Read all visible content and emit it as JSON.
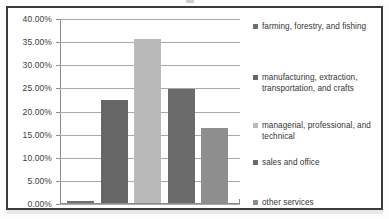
{
  "chart_data": {
    "type": "bar",
    "title": "",
    "subtitle": "",
    "xlabel": "",
    "ylabel": "",
    "categories": [
      "farming, forestry, and fishing",
      "manufacturing, extraction, transportation, and crafts",
      "managerial, professional, and technical",
      "sales and office",
      "other services"
    ],
    "values": [
      0.4,
      22.3,
      35.4,
      24.7,
      16.3
    ],
    "value_labels": [
      "0.40%",
      "22.30%",
      "35.40%",
      "24.70%",
      "16.30%"
    ],
    "ylim": [
      0,
      40
    ],
    "ytick_values": [
      0,
      5,
      10,
      15,
      20,
      25,
      30,
      35,
      40
    ],
    "ytick_labels": [
      "0.00%",
      "5.00%",
      "10.00%",
      "15.00%",
      "20.00%",
      "25.00%",
      "30.00%",
      "35.00%",
      "40.00%"
    ],
    "grid": true,
    "grid_axis": "y",
    "legend_position": "right",
    "xtick_labels": [],
    "series_colors": [
      "#6e6e6e",
      "#666666",
      "#b9b9b9",
      "#6b6b6b",
      "#8e8e8e"
    ]
  },
  "axis": {
    "y_ticks": [
      {
        "label": "40.00%",
        "value": 40
      },
      {
        "label": "35.00%",
        "value": 35
      },
      {
        "label": "30.00%",
        "value": 30
      },
      {
        "label": "25.00%",
        "value": 25
      },
      {
        "label": "20.00%",
        "value": 20
      },
      {
        "label": "15.00%",
        "value": 15
      },
      {
        "label": "10.00%",
        "value": 10
      },
      {
        "label": "5.00%",
        "value": 5
      },
      {
        "label": "0.00%",
        "value": 0
      }
    ]
  },
  "legend": {
    "items": [
      {
        "label": "farming, forestry, and fishing",
        "color": "#6e6e6e"
      },
      {
        "label": "manufacturing, extraction, transportation, and crafts",
        "color": "#666666"
      },
      {
        "label": "managerial, professional, and technical",
        "color": "#b9b9b9"
      },
      {
        "label": "sales and office",
        "color": "#6b6b6b"
      },
      {
        "label": "other services",
        "color": "#8e8e8e"
      }
    ]
  },
  "colors": {
    "frame": "#3b3b3b",
    "gridline": "#a8a8a8",
    "axis": "#8c8c8c",
    "background": "#ffffff",
    "text": "#3d3d3d"
  }
}
